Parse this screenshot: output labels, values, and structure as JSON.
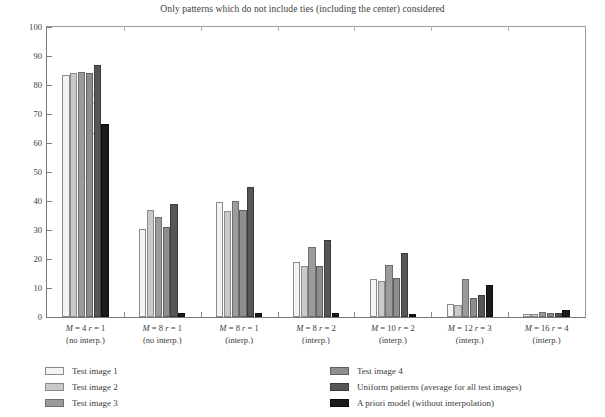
{
  "chart_data": {
    "type": "bar",
    "title": "Only patterns which do not include ties (including the center) considered",
    "xlabel": "",
    "ylabel": "Runs level 2 patterns (%)",
    "ylim": [
      0,
      100
    ],
    "yticks": [
      0,
      10,
      20,
      30,
      40,
      50,
      60,
      70,
      80,
      90,
      100
    ],
    "grid": false,
    "legend_position": "below-plot-two-columns",
    "categories": [
      "M = 4  r = 1 (no interp.)",
      "M = 8  r = 1 (no interp.)",
      "M = 8  r = 1 (interp.)",
      "M = 8  r = 2 (interp.)",
      "M = 10  r = 2 (interp.)",
      "M = 12  r = 3 (interp.)",
      "M = 16  r = 4 (interp.)"
    ],
    "category_lines": [
      {
        "line1_pre": "M",
        "line1_eq1": " = 4  ",
        "line1_r": "r",
        "line1_eq2": " = 1",
        "line2": "(no interp.)"
      },
      {
        "line1_pre": "M",
        "line1_eq1": " = 8  ",
        "line1_r": "r",
        "line1_eq2": " = 1",
        "line2": "(no interp.)"
      },
      {
        "line1_pre": "M",
        "line1_eq1": " = 8  ",
        "line1_r": "r",
        "line1_eq2": " = 1",
        "line2": "(interp.)"
      },
      {
        "line1_pre": "M",
        "line1_eq1": " = 8  ",
        "line1_r": "r",
        "line1_eq2": " = 2",
        "line2": "(interp.)"
      },
      {
        "line1_pre": "M",
        "line1_eq1": " = 10  ",
        "line1_r": "r",
        "line1_eq2": " = 2",
        "line2": "(interp.)"
      },
      {
        "line1_pre": "M",
        "line1_eq1": " = 12  ",
        "line1_r": "r",
        "line1_eq2": " = 3",
        "line2": "(interp.)"
      },
      {
        "line1_pre": "M",
        "line1_eq1": " = 16  ",
        "line1_r": "r",
        "line1_eq2": " = 4",
        "line2": "(interp.)"
      }
    ],
    "series": [
      {
        "name": "Test image 1",
        "color": "#f4f4f4",
        "values": [
          83.5,
          30.5,
          39.5,
          19.0,
          13.0,
          4.5,
          1.2
        ]
      },
      {
        "name": "Test image 2",
        "color": "#c9c9c9",
        "values": [
          84.0,
          37.0,
          36.5,
          17.5,
          12.5,
          4.0,
          1.2
        ]
      },
      {
        "name": "Test image 3",
        "color": "#9b9b9b",
        "values": [
          84.5,
          34.5,
          40.0,
          24.0,
          18.0,
          13.0,
          1.7
        ]
      },
      {
        "name": "Test image 4",
        "color": "#8e8e8e",
        "values": [
          84.0,
          31.0,
          37.0,
          17.5,
          13.5,
          6.5,
          1.3
        ]
      },
      {
        "name": "Uniform patterns (average for all test images)",
        "color": "#565656",
        "values": [
          87.0,
          39.0,
          45.0,
          26.5,
          22.0,
          7.5,
          1.5
        ]
      },
      {
        "name": "A priori model (without interpolation)",
        "color": "#1b1b1b",
        "values": [
          66.5,
          1.5,
          1.4,
          1.3,
          0.9,
          11.0,
          2.5
        ]
      }
    ]
  },
  "legend": {
    "left_items": [
      {
        "label": "Test image 1",
        "swatch": "#f4f4f4",
        "border": "#8a8a8a"
      },
      {
        "label": "Test image 2",
        "swatch": "#c9c9c9",
        "border": "#8a8a8a"
      },
      {
        "label": "Test image 3",
        "swatch": "#9b9b9b",
        "border": "#6e6e6e"
      }
    ],
    "right_items": [
      {
        "label": "Test image 4",
        "swatch": "#8e8e8e",
        "border": "#5f5f5f"
      },
      {
        "label": "Uniform patterns (average for all test images)",
        "swatch": "#565656",
        "border": "#3a3a3a"
      },
      {
        "label": "A priori model (without interpolation)",
        "swatch": "#1b1b1b",
        "border": "#0d0d0d"
      }
    ]
  }
}
